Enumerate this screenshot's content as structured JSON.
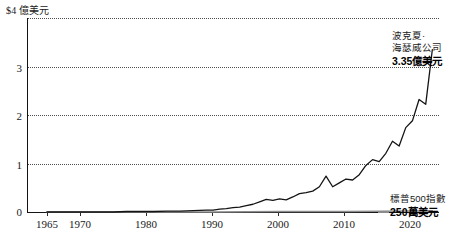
{
  "chart_data": {
    "type": "line",
    "title": "",
    "subtitle": "",
    "xlabel": "",
    "ylabel": "$4 億美元",
    "y_unit_caption": "$4 億美元",
    "xlim": [
      1962,
      2024
    ],
    "ylim": [
      0,
      4
    ],
    "grid": true,
    "grid_style": "dotted-horizontal",
    "legend": "inline-annotations",
    "y_ticks": [
      {
        "value": 0,
        "label": "0"
      },
      {
        "value": 1,
        "label": "1"
      },
      {
        "value": 2,
        "label": "2"
      },
      {
        "value": 3,
        "label": "3"
      },
      {
        "value": 4,
        "label": ""
      }
    ],
    "x_ticks": [
      {
        "value": 1965,
        "label": "1965"
      },
      {
        "value": 1970,
        "label": "1970"
      },
      {
        "value": 1980,
        "label": "1980"
      },
      {
        "value": 1990,
        "label": "1990"
      },
      {
        "value": 2000,
        "label": "2000"
      },
      {
        "value": 2010,
        "label": "2010"
      },
      {
        "value": 2020,
        "label": "2020"
      }
    ],
    "series": [
      {
        "name": "波克夏·海瑟威公司",
        "color": "#141414",
        "final_label": "3.35億美元",
        "x": [
          1965,
          1967,
          1969,
          1971,
          1973,
          1975,
          1977,
          1979,
          1981,
          1983,
          1985,
          1987,
          1989,
          1990,
          1991,
          1992,
          1993,
          1994,
          1995,
          1996,
          1997,
          1998,
          1999,
          2000,
          2001,
          2002,
          2003,
          2004,
          2005,
          2006,
          2007,
          2008,
          2009,
          2010,
          2011,
          2012,
          2013,
          2014,
          2015,
          2016,
          2017,
          2018,
          2019,
          2020,
          2021,
          2022,
          2023
        ],
        "y": [
          0.0,
          0.0,
          0.0,
          0.0,
          0.0,
          0.0,
          0.01,
          0.01,
          0.01,
          0.02,
          0.02,
          0.03,
          0.04,
          0.04,
          0.06,
          0.07,
          0.09,
          0.1,
          0.13,
          0.16,
          0.21,
          0.26,
          0.24,
          0.27,
          0.25,
          0.31,
          0.38,
          0.4,
          0.43,
          0.52,
          0.74,
          0.52,
          0.6,
          0.68,
          0.66,
          0.77,
          0.96,
          1.08,
          1.04,
          1.21,
          1.46,
          1.36,
          1.74,
          1.88,
          2.32,
          2.22,
          3.35
        ]
      },
      {
        "name": "標普500指數",
        "color": "#8c8c8c",
        "final_label": "250萬美元",
        "x": [
          1965,
          1980,
          1990,
          2000,
          2010,
          2020,
          2023
        ],
        "y": [
          0.0,
          0.0,
          0.0,
          0.01,
          0.01,
          0.02,
          0.025
        ]
      }
    ]
  },
  "annotations": {
    "berkshire": {
      "line1": "波克夏·",
      "line2": "海瑟威公司",
      "value": "3.35億美元"
    },
    "sp500": {
      "line1": "標普500指數",
      "value": "250萬美元"
    }
  },
  "axis": {
    "y_unit": "$4 億美元",
    "y_labels": [
      "3",
      "2",
      "1",
      "0"
    ],
    "x_labels": [
      "1965",
      "1970",
      "1980",
      "1990",
      "2000",
      "2010",
      "2020"
    ]
  }
}
